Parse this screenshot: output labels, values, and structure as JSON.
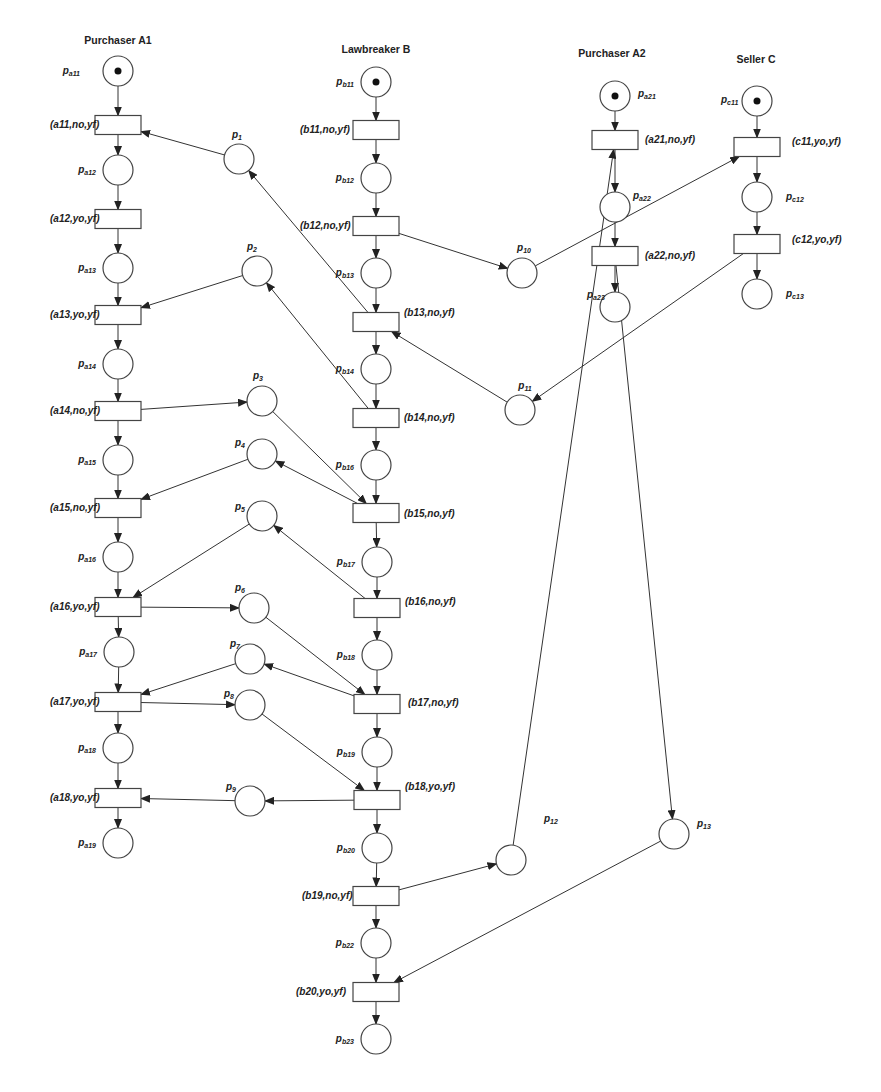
{
  "diagram": {
    "type": "petri-net",
    "colors": {
      "stroke": "#444444",
      "token": "#111111",
      "background": "#ffffff"
    },
    "lanes": [
      {
        "id": "A1",
        "title": "Purchaser A1",
        "x": 118,
        "y": 44
      },
      {
        "id": "B",
        "title": "Lawbreaker B",
        "x": 376,
        "y": 53
      },
      {
        "id": "A2",
        "title": "Purchaser A2",
        "x": 612,
        "y": 57
      },
      {
        "id": "C",
        "title": "Seller C",
        "x": 756,
        "y": 63
      }
    ],
    "places": [
      {
        "id": "pa11",
        "base": "p",
        "sub": "a11",
        "x": 118,
        "y": 71,
        "tokens": 1,
        "lx": 80,
        "ly": 74,
        "anchor": "end"
      },
      {
        "id": "pa12",
        "base": "p",
        "sub": "a12",
        "x": 118,
        "y": 170,
        "tokens": 0,
        "lx": 96,
        "ly": 173,
        "anchor": "end"
      },
      {
        "id": "pa13",
        "base": "p",
        "sub": "a13",
        "x": 118,
        "y": 268,
        "tokens": 0,
        "lx": 96,
        "ly": 271,
        "anchor": "end"
      },
      {
        "id": "pa14",
        "base": "p",
        "sub": "a14",
        "x": 118,
        "y": 364,
        "tokens": 0,
        "lx": 96,
        "ly": 367,
        "anchor": "end"
      },
      {
        "id": "pa15",
        "base": "p",
        "sub": "a15",
        "x": 118,
        "y": 460,
        "tokens": 0,
        "lx": 96,
        "ly": 463,
        "anchor": "end"
      },
      {
        "id": "pa16",
        "base": "p",
        "sub": "a16",
        "x": 118,
        "y": 557,
        "tokens": 0,
        "lx": 96,
        "ly": 560,
        "anchor": "end"
      },
      {
        "id": "pa17",
        "base": "p",
        "sub": "a17",
        "x": 119,
        "y": 652,
        "tokens": 0,
        "lx": 97,
        "ly": 655,
        "anchor": "end"
      },
      {
        "id": "pa18",
        "base": "p",
        "sub": "a18",
        "x": 118,
        "y": 748,
        "tokens": 0,
        "lx": 96,
        "ly": 751,
        "anchor": "end"
      },
      {
        "id": "pa19",
        "base": "p",
        "sub": "a19",
        "x": 118,
        "y": 843,
        "tokens": 0,
        "lx": 96,
        "ly": 846,
        "anchor": "end"
      },
      {
        "id": "pb11",
        "base": "p",
        "sub": "b11",
        "x": 376,
        "y": 82,
        "tokens": 1,
        "lx": 354,
        "ly": 85,
        "anchor": "end"
      },
      {
        "id": "pb12",
        "base": "p",
        "sub": "b12",
        "x": 376,
        "y": 178,
        "tokens": 0,
        "lx": 354,
        "ly": 181,
        "anchor": "end"
      },
      {
        "id": "pb13",
        "base": "p",
        "sub": "b13",
        "x": 376,
        "y": 273,
        "tokens": 0,
        "lx": 354,
        "ly": 276,
        "anchor": "end"
      },
      {
        "id": "pb14",
        "base": "p",
        "sub": "b14",
        "x": 376,
        "y": 369,
        "tokens": 0,
        "lx": 354,
        "ly": 372,
        "anchor": "end"
      },
      {
        "id": "pb16",
        "base": "p",
        "sub": "b16",
        "x": 376,
        "y": 465,
        "tokens": 0,
        "lx": 354,
        "ly": 468,
        "anchor": "end"
      },
      {
        "id": "pb17",
        "base": "p",
        "sub": "b17",
        "x": 377,
        "y": 562,
        "tokens": 0,
        "lx": 355,
        "ly": 565,
        "anchor": "end"
      },
      {
        "id": "pb18",
        "base": "p",
        "sub": "b18",
        "x": 377,
        "y": 655,
        "tokens": 0,
        "lx": 355,
        "ly": 658,
        "anchor": "end"
      },
      {
        "id": "pb19",
        "base": "p",
        "sub": "b19",
        "x": 377,
        "y": 752,
        "tokens": 0,
        "lx": 355,
        "ly": 755,
        "anchor": "end"
      },
      {
        "id": "pb20",
        "base": "p",
        "sub": "b20",
        "x": 377,
        "y": 848,
        "tokens": 0,
        "lx": 355,
        "ly": 851,
        "anchor": "end"
      },
      {
        "id": "pb22",
        "base": "p",
        "sub": "b22",
        "x": 376,
        "y": 943,
        "tokens": 0,
        "lx": 354,
        "ly": 946,
        "anchor": "end"
      },
      {
        "id": "pb23",
        "base": "p",
        "sub": "b23",
        "x": 376,
        "y": 1039,
        "tokens": 0,
        "lx": 354,
        "ly": 1042,
        "anchor": "end"
      },
      {
        "id": "pa21",
        "base": "p",
        "sub": "a21",
        "x": 615,
        "y": 96,
        "tokens": 1,
        "lx": 638,
        "ly": 97,
        "anchor": "start"
      },
      {
        "id": "pa22",
        "base": "p",
        "sub": "a22",
        "x": 615,
        "y": 207,
        "tokens": 0,
        "lx": 633,
        "ly": 199,
        "anchor": "start"
      },
      {
        "id": "pa23",
        "base": "p",
        "sub": "a23",
        "x": 615,
        "y": 307,
        "tokens": 0,
        "lx": 587,
        "ly": 298,
        "anchor": "start"
      },
      {
        "id": "pc11",
        "base": "p",
        "sub": "c11",
        "x": 757,
        "y": 101,
        "tokens": 1,
        "lx": 721,
        "ly": 103,
        "anchor": "start"
      },
      {
        "id": "pc12",
        "base": "p",
        "sub": "c12",
        "x": 757,
        "y": 197,
        "tokens": 0,
        "lx": 786,
        "ly": 200,
        "anchor": "start"
      },
      {
        "id": "pc13",
        "base": "p",
        "sub": "c13",
        "x": 757,
        "y": 294,
        "tokens": 0,
        "lx": 786,
        "ly": 297,
        "anchor": "start"
      },
      {
        "id": "p1",
        "base": "p",
        "sub": "1",
        "x": 239,
        "y": 159,
        "tokens": 0,
        "lx": 237,
        "ly": 138,
        "anchor": "middle"
      },
      {
        "id": "p2",
        "base": "p",
        "sub": "2",
        "x": 257,
        "y": 271,
        "tokens": 0,
        "lx": 252,
        "ly": 250,
        "anchor": "middle"
      },
      {
        "id": "p3",
        "base": "p",
        "sub": "3",
        "x": 262,
        "y": 401,
        "tokens": 0,
        "lx": 258,
        "ly": 379,
        "anchor": "middle"
      },
      {
        "id": "p4",
        "base": "p",
        "sub": "4",
        "x": 262,
        "y": 454,
        "tokens": 0,
        "lx": 240,
        "ly": 446,
        "anchor": "middle"
      },
      {
        "id": "p5",
        "base": "p",
        "sub": "5",
        "x": 262,
        "y": 516,
        "tokens": 0,
        "lx": 240,
        "ly": 510,
        "anchor": "middle"
      },
      {
        "id": "p6",
        "base": "p",
        "sub": "6",
        "x": 254,
        "y": 608,
        "tokens": 0,
        "lx": 240,
        "ly": 591,
        "anchor": "middle"
      },
      {
        "id": "p7",
        "base": "p",
        "sub": "7",
        "x": 250,
        "y": 659,
        "tokens": 0,
        "lx": 235,
        "ly": 647,
        "anchor": "middle"
      },
      {
        "id": "p8",
        "base": "p",
        "sub": "8",
        "x": 250,
        "y": 705,
        "tokens": 0,
        "lx": 229,
        "ly": 697,
        "anchor": "middle"
      },
      {
        "id": "p9",
        "base": "p",
        "sub": "9",
        "x": 250,
        "y": 801,
        "tokens": 0,
        "lx": 231,
        "ly": 790,
        "anchor": "middle"
      },
      {
        "id": "p10",
        "base": "p",
        "sub": "10",
        "x": 522,
        "y": 273,
        "tokens": 0,
        "lx": 524,
        "ly": 251,
        "anchor": "middle"
      },
      {
        "id": "p11",
        "base": "p",
        "sub": "11",
        "x": 520,
        "y": 410,
        "tokens": 0,
        "lx": 525,
        "ly": 389,
        "anchor": "middle"
      },
      {
        "id": "p12",
        "base": "p",
        "sub": "12",
        "x": 511,
        "y": 860,
        "tokens": 0,
        "lx": 544,
        "ly": 822,
        "anchor": "start"
      },
      {
        "id": "p13",
        "base": "p",
        "sub": "13",
        "x": 674,
        "y": 834,
        "tokens": 0,
        "lx": 697,
        "ly": 827,
        "anchor": "start"
      }
    ],
    "transitions": [
      {
        "id": "a11",
        "label": "(a11,no,yf)",
        "x": 118,
        "y": 125,
        "lx": 50,
        "ly": 128,
        "anchor": "start"
      },
      {
        "id": "a12",
        "label": "(a12,yo,yf)",
        "x": 118,
        "y": 219,
        "lx": 50,
        "ly": 222,
        "anchor": "start"
      },
      {
        "id": "a13",
        "label": "(a13,yo,yf)",
        "x": 118,
        "y": 315,
        "lx": 50,
        "ly": 318,
        "anchor": "start"
      },
      {
        "id": "a14",
        "label": "(a14,no,yf)",
        "x": 118,
        "y": 411,
        "lx": 50,
        "ly": 414,
        "anchor": "start"
      },
      {
        "id": "a15",
        "label": "(a15,no,yf)",
        "x": 118,
        "y": 508,
        "lx": 50,
        "ly": 511,
        "anchor": "start"
      },
      {
        "id": "a16",
        "label": "(a16,yo,yf)",
        "x": 118,
        "y": 607,
        "lx": 50,
        "ly": 610,
        "anchor": "start"
      },
      {
        "id": "a17",
        "label": "(a17,yo,yf)",
        "x": 118,
        "y": 702,
        "lx": 50,
        "ly": 705,
        "anchor": "start"
      },
      {
        "id": "a18",
        "label": "(a18,yo,yf)",
        "x": 118,
        "y": 798,
        "lx": 50,
        "ly": 801,
        "anchor": "start"
      },
      {
        "id": "b11",
        "label": "(b11,no,yf)",
        "x": 376,
        "y": 130,
        "lx": 300,
        "ly": 133,
        "anchor": "start"
      },
      {
        "id": "b12",
        "label": "(b12,no,yf)",
        "x": 376,
        "y": 226,
        "lx": 300,
        "ly": 229,
        "anchor": "start"
      },
      {
        "id": "b13",
        "label": "(b13,no,yf)",
        "x": 376,
        "y": 322,
        "lx": 404,
        "ly": 316,
        "anchor": "start"
      },
      {
        "id": "b14",
        "label": "(b14,no,yf)",
        "x": 376,
        "y": 418,
        "lx": 404,
        "ly": 421,
        "anchor": "start"
      },
      {
        "id": "b15",
        "label": "(b15,no,yf)",
        "x": 376,
        "y": 513,
        "lx": 404,
        "ly": 517,
        "anchor": "start"
      },
      {
        "id": "b16",
        "label": "(b16,no,yf)",
        "x": 377,
        "y": 608,
        "lx": 405,
        "ly": 605,
        "anchor": "start"
      },
      {
        "id": "b17",
        "label": "(b17,no,yf)",
        "x": 377,
        "y": 704,
        "lx": 408,
        "ly": 706,
        "anchor": "start"
      },
      {
        "id": "b18",
        "label": "(b18,yo,yf)",
        "x": 377,
        "y": 800,
        "lx": 405,
        "ly": 790,
        "anchor": "start"
      },
      {
        "id": "b19",
        "label": "(b19,no,yf)",
        "x": 376,
        "y": 896,
        "lx": 302,
        "ly": 899,
        "anchor": "start"
      },
      {
        "id": "b20",
        "label": "(b20,yo,yf)",
        "x": 376,
        "y": 992,
        "lx": 296,
        "ly": 995,
        "anchor": "start"
      },
      {
        "id": "a21",
        "label": "(a21,no,yf)",
        "x": 615,
        "y": 140,
        "lx": 645,
        "ly": 143,
        "anchor": "start"
      },
      {
        "id": "a22",
        "label": "(a22,no,yf)",
        "x": 615,
        "y": 256,
        "lx": 645,
        "ly": 259,
        "anchor": "start"
      },
      {
        "id": "c11",
        "label": "(c11,yo,yf)",
        "x": 757,
        "y": 147,
        "lx": 792,
        "ly": 145,
        "anchor": "start"
      },
      {
        "id": "c12",
        "label": "(c12,yo,yf)",
        "x": 757,
        "y": 244,
        "lx": 792,
        "ly": 243,
        "anchor": "start"
      }
    ],
    "arcs": [
      [
        "pa11",
        "a11"
      ],
      [
        "a11",
        "pa12"
      ],
      [
        "pa12",
        "a12"
      ],
      [
        "a12",
        "pa13"
      ],
      [
        "pa13",
        "a13"
      ],
      [
        "a13",
        "pa14"
      ],
      [
        "pa14",
        "a14"
      ],
      [
        "a14",
        "pa15"
      ],
      [
        "pa15",
        "a15"
      ],
      [
        "a15",
        "pa16"
      ],
      [
        "pa16",
        "a16"
      ],
      [
        "a16",
        "pa17"
      ],
      [
        "pa17",
        "a17"
      ],
      [
        "a17",
        "pa18"
      ],
      [
        "pa18",
        "a18"
      ],
      [
        "a18",
        "pa19"
      ],
      [
        "pb11",
        "b11"
      ],
      [
        "b11",
        "pb12"
      ],
      [
        "pb12",
        "b12"
      ],
      [
        "b12",
        "pb13"
      ],
      [
        "pb13",
        "b13"
      ],
      [
        "b13",
        "pb14"
      ],
      [
        "pb14",
        "b14"
      ],
      [
        "b14",
        "pb16"
      ],
      [
        "pb16",
        "b15"
      ],
      [
        "b15",
        "pb17"
      ],
      [
        "pb17",
        "b16"
      ],
      [
        "b16",
        "pb18"
      ],
      [
        "pb18",
        "b17"
      ],
      [
        "b17",
        "pb19"
      ],
      [
        "pb19",
        "b18"
      ],
      [
        "b18",
        "pb20"
      ],
      [
        "pb20",
        "b19"
      ],
      [
        "b19",
        "pb22"
      ],
      [
        "pb22",
        "b20"
      ],
      [
        "b20",
        "pb23"
      ],
      [
        "pa21",
        "a21"
      ],
      [
        "a21",
        "pa22"
      ],
      [
        "pa22",
        "a22"
      ],
      [
        "a22",
        "pa23"
      ],
      [
        "pc11",
        "c11"
      ],
      [
        "c11",
        "pc12"
      ],
      [
        "pc12",
        "c12"
      ],
      [
        "c12",
        "pc13"
      ],
      [
        "b13",
        "p1"
      ],
      [
        "p1",
        "a11"
      ],
      [
        "b14",
        "p2"
      ],
      [
        "p2",
        "a13"
      ],
      [
        "a14",
        "p3"
      ],
      [
        "p3",
        "b15"
      ],
      [
        "b15",
        "p4"
      ],
      [
        "p4",
        "a15"
      ],
      [
        "b16",
        "p5"
      ],
      [
        "p5",
        "a16"
      ],
      [
        "a16",
        "p6"
      ],
      [
        "p6",
        "b17"
      ],
      [
        "b17",
        "p7"
      ],
      [
        "p7",
        "a17"
      ],
      [
        "a17",
        "p8"
      ],
      [
        "p8",
        "b18"
      ],
      [
        "b18",
        "p9"
      ],
      [
        "p9",
        "a18"
      ],
      [
        "b12",
        "p10"
      ],
      [
        "p10",
        "c11"
      ],
      [
        "c12",
        "p11"
      ],
      [
        "p11",
        "b13"
      ],
      [
        "b19",
        "p12"
      ],
      [
        "p12",
        "a21"
      ],
      [
        "a22",
        "p13"
      ],
      [
        "p13",
        "b20"
      ]
    ]
  }
}
